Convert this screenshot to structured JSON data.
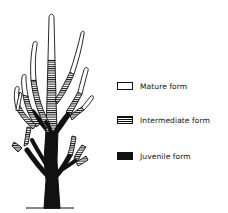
{
  "diagram": {
    "colors": {
      "outline": "#111111",
      "mature_fill": "#ffffff",
      "intermediate_fill": "hatched",
      "juvenile_fill": "#111111",
      "background": "#ffffff"
    }
  },
  "legend": {
    "items": [
      {
        "key": "mature",
        "label": "Mature form"
      },
      {
        "key": "intermediate",
        "label": "Intermediate form"
      },
      {
        "key": "juvenile",
        "label": "Juvenile form"
      }
    ]
  }
}
